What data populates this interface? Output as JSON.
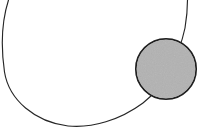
{
  "figure": {
    "title": "Necklace-like line drawing with filled gray disc",
    "width": 220,
    "height": 133,
    "background_color": "#ffffff",
    "shapes": [
      {
        "name": "open-loop-arc",
        "kind": "arc",
        "description": "Large thin open curve (necklace cord) spanning from top-left down around the bottom and up to the top-right, open at the top",
        "stroke_color": "#262626",
        "stroke_width": 1.1,
        "fill": "none",
        "start_point": [
          8,
          0
        ],
        "leftmost_point": [
          3,
          70
        ],
        "bottom_point": [
          97,
          126
        ],
        "end_point": [
          187,
          0
        ],
        "center": [
          98,
          62
        ],
        "radius_x": 95,
        "radius_y": 64
      },
      {
        "name": "gray-disc",
        "kind": "circle",
        "description": "Filled gray circle with dark outline overlapping the right portion of the arc",
        "center": [
          166,
          69
        ],
        "radius": 30.5,
        "fill_color": "#b2b2b2",
        "stroke_color": "#1f1f1f",
        "stroke_width": 1.6
      }
    ]
  }
}
